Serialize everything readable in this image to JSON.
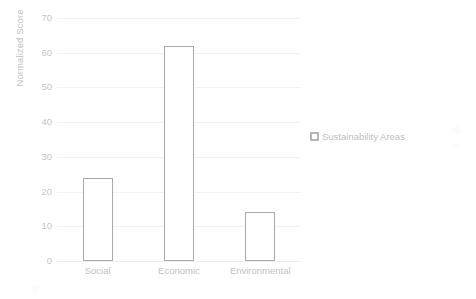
{
  "chart_data": {
    "type": "bar",
    "title": "",
    "subtitle": "",
    "xlabel": "",
    "ylabel": "Normalized Score",
    "categories": [
      "Social",
      "Economic",
      "Environmental"
    ],
    "values": [
      24,
      62,
      14
    ],
    "series": [
      {
        "name": "Sustainability Areas",
        "values": [
          24,
          62,
          14
        ]
      }
    ],
    "ylim": [
      0,
      70
    ],
    "ytick_step": 10,
    "yticks": [
      70,
      60,
      50,
      40,
      30,
      20,
      10,
      0
    ],
    "ytick_labels": [
      "70",
      "60",
      "50",
      "40",
      "30",
      "20",
      "10",
      "0"
    ],
    "grid": true,
    "grid_axis": "y",
    "legend": true,
    "legend_position": "right",
    "legend_entries": [
      "Sustainability Areas"
    ],
    "bar_fill_color": "#ffffff",
    "bar_border_color": "#a9a9a9",
    "gridline_color": "#f2f2f2",
    "text_color": "#c2c2c2",
    "background_color": "#ffffff"
  },
  "legend": {
    "marker_name": "legend-square-marker",
    "label": "Sustainability Areas"
  },
  "axes": {
    "y_title": "Normalized Score"
  }
}
